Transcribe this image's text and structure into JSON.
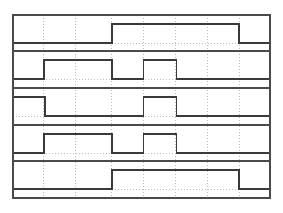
{
  "figure": {
    "title": "",
    "kind": "digital-timing-diagram",
    "background_color": "#ffffff",
    "line_color": "#3a3a3a",
    "grid_color": "#bdbdbd",
    "border_color": "#4a4a4a"
  },
  "chart_data": {
    "type": "line",
    "title": "",
    "xlabel": "",
    "ylabel": "",
    "grid": true,
    "legend": "none",
    "xlim": [
      0,
      8
    ],
    "ylim": [
      0,
      1
    ],
    "x_gridlines": [
      1,
      2,
      3,
      4,
      5,
      6,
      7
    ],
    "x_tick_labels": [],
    "y_tick_labels": [],
    "categories": [
      "0",
      "1",
      "2",
      "3",
      "4",
      "5",
      "6",
      "7",
      "8"
    ],
    "series": [
      {
        "name": "Signal 1",
        "row": 1,
        "start_level": 0,
        "transitions": [
          {
            "x": 3.09,
            "level": 1
          },
          {
            "x": 7.04,
            "level": 0
          }
        ],
        "values": [
          0,
          0,
          0,
          1,
          1,
          1,
          1,
          1,
          0
        ]
      },
      {
        "name": "Signal 2",
        "row": 2,
        "start_level": 0,
        "transitions": [
          {
            "x": 0.97,
            "level": 1
          },
          {
            "x": 3.09,
            "level": 0
          },
          {
            "x": 4.06,
            "level": 1
          },
          {
            "x": 5.09,
            "level": 0
          }
        ],
        "values": [
          0,
          1,
          1,
          0,
          1,
          0,
          0,
          0,
          0
        ]
      },
      {
        "name": "Signal 3",
        "row": 3,
        "start_level": 1,
        "transitions": [
          {
            "x": 1.0,
            "level": 0
          },
          {
            "x": 4.06,
            "level": 1
          },
          {
            "x": 5.09,
            "level": 0
          }
        ],
        "values": [
          1,
          0,
          0,
          0,
          1,
          0,
          0,
          0,
          0
        ]
      },
      {
        "name": "Signal 4",
        "row": 4,
        "start_level": 0,
        "transitions": [
          {
            "x": 0.97,
            "level": 1
          },
          {
            "x": 3.09,
            "level": 0
          },
          {
            "x": 4.06,
            "level": 1
          },
          {
            "x": 5.09,
            "level": 0
          }
        ],
        "values": [
          0,
          1,
          1,
          0,
          1,
          0,
          0,
          0,
          0
        ]
      },
      {
        "name": "Signal 5",
        "row": 5,
        "start_level": 0,
        "transitions": [
          {
            "x": 3.09,
            "level": 1
          },
          {
            "x": 7.04,
            "level": 0
          }
        ],
        "values": [
          0,
          0,
          0,
          1,
          1,
          1,
          1,
          1,
          0
        ]
      }
    ]
  },
  "geometry": {
    "plot_left": 13,
    "plot_right": 270,
    "plot_top": 15,
    "plot_bottom": 198,
    "row_boundaries": [
      15,
      51,
      88,
      125,
      161,
      198
    ],
    "vertical_gridlines": [
      43.7,
      75.0,
      111.0,
      143.0,
      175.5,
      207.5,
      239.0
    ],
    "signal_high_offset": 9,
    "signal_low_offset": 28
  }
}
